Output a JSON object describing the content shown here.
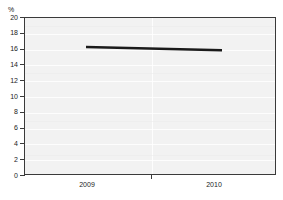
{
  "chart_data": {
    "type": "line",
    "title": "",
    "title_clipped": true,
    "xlabel": "",
    "ylabel": "%",
    "ylim": [
      0,
      20
    ],
    "yticks": [
      0,
      2,
      4,
      6,
      8,
      10,
      12,
      14,
      16,
      18,
      20
    ],
    "ytick_labels": [
      "0",
      "2",
      "4",
      "6",
      "8",
      "10",
      "12",
      "14",
      "16",
      "18",
      "20"
    ],
    "x": [
      "2009",
      "2010"
    ],
    "xtick_labels": [
      "2009",
      "2010"
    ],
    "grid": true,
    "legend": "none",
    "series": [
      {
        "name": "series-1",
        "x": [
          "2009",
          "2010"
        ],
        "values": [
          16.2,
          15.8
        ],
        "color": "#1a1a1a"
      }
    ],
    "colors": {
      "plot_background": "#f2f2f2",
      "grid": "#ffffff",
      "frame": "#3a3a3a",
      "line": "#1a1a1a",
      "text": "#1a1a1a",
      "page_background": "#ffffff"
    }
  }
}
